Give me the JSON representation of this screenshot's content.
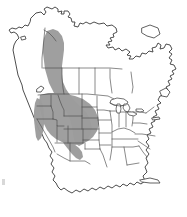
{
  "figure": {
    "kind": "species-range-map",
    "title": "North America distribution map",
    "width_px": 187,
    "height_px": 217,
    "background_color": "#ffffff",
    "outline_color": "#3a3a3a",
    "internal_border_color": "#4a4a4a",
    "range_fill_color": "#9c9c9c",
    "caption": "",
    "legend": [],
    "labels": []
  },
  "chart_data": {
    "type": "map",
    "title": "North America distribution map",
    "projection_note": "unprojected schematic outline of North America",
    "shaded_meaning": "species range / distribution",
    "regions_shaded": [
      "Southeast Alaska (coastal strip)",
      "Yukon (southwest)",
      "British Columbia",
      "Alberta (west edge)",
      "Washington",
      "Oregon",
      "Idaho",
      "Montana (west and central)",
      "Wyoming",
      "Nevada (north and east)",
      "Utah",
      "Colorado (west)",
      "Arizona (north edge)",
      "New Mexico (northwest edge)"
    ],
    "regions_unshaded": [
      "mainland Alaska",
      "Northwest Territories",
      "Nunavut",
      "Saskatchewan",
      "Manitoba",
      "Ontario",
      "Quebec",
      "Atlantic Canada",
      "California",
      "Great Plains states",
      "Midwest",
      "Northeast United States",
      "Southeast United States",
      "Texas",
      "Mexico",
      "Baja California",
      "Yucatan Peninsula",
      "Central America"
    ],
    "features_drawn": [
      "continental coastline",
      "Canadian province boundaries",
      "United States state boundaries",
      "Great Lakes",
      "Hudson Bay",
      "Baja California peninsula",
      "Gulf of Mexico",
      "Florida peninsula",
      "Aleutian / Alaska peninsula"
    ],
    "grid": false,
    "legend_position": "none",
    "axis": {
      "xlabel": "",
      "ylabel": "",
      "ticks": []
    }
  }
}
